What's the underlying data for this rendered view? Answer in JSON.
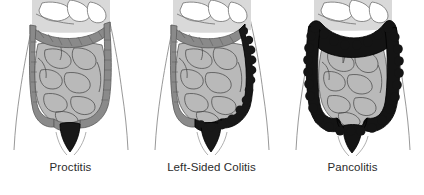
{
  "figure": {
    "background_color": "#ffffff",
    "width": 424,
    "height": 195,
    "panel_count": 3
  },
  "palette": {
    "body_outline": "#8d8d8d",
    "upper_organs_fill": "#d4d4d4",
    "upper_organs_line": "#6f6f6f",
    "small_intestine_fill": "#b8b8b8",
    "small_intestine_line": "#4a4a4a",
    "normal_colon_fill": "#8a8a8a",
    "normal_colon_line": "#5a5a5a",
    "inflamed_colon_fill": "#151515",
    "inflamed_colon_line": "#000000",
    "label_text": "#2b2b2b"
  },
  "panels": [
    {
      "id": "proctitis",
      "label": "Proctitis",
      "affected_segments": [
        "rectum"
      ],
      "normal_segments": [
        "cecum",
        "ascending-colon",
        "hepatic-flexure",
        "transverse-colon",
        "splenic-flexure",
        "descending-colon",
        "sigmoid-colon"
      ],
      "disease_extent": "rectum only"
    },
    {
      "id": "left-sided-colitis",
      "label": "Left-Sided Colitis",
      "affected_segments": [
        "rectum",
        "sigmoid-colon",
        "descending-colon",
        "splenic-flexure"
      ],
      "normal_segments": [
        "cecum",
        "ascending-colon",
        "hepatic-flexure",
        "transverse-colon"
      ],
      "disease_extent": "rectum to splenic flexure"
    },
    {
      "id": "pancolitis",
      "label": "Pancolitis",
      "affected_segments": [
        "rectum",
        "sigmoid-colon",
        "descending-colon",
        "splenic-flexure",
        "transverse-colon",
        "hepatic-flexure",
        "ascending-colon",
        "cecum"
      ],
      "normal_segments": [],
      "disease_extent": "entire colon"
    }
  ]
}
